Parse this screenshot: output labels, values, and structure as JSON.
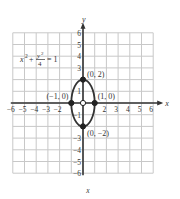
{
  "chart_data": {
    "type": "line",
    "title": "",
    "equation": "x² + y²/4 = 1",
    "equation_parts": {
      "x_term": "x",
      "x_exp": "2",
      "plus": "+",
      "y_num": "y",
      "y_exp": "2",
      "denom": "4",
      "equals": "= 1"
    },
    "xlabel": "x",
    "ylabel": "y",
    "caption": "x",
    "xlim": [
      -6,
      6
    ],
    "ylim": [
      -6,
      6
    ],
    "grid": true,
    "x_ticks": [
      "-6",
      "-5",
      "-4",
      "-3",
      "-2",
      "",
      "",
      "2",
      "3",
      "4",
      "5",
      "6"
    ],
    "y_ticks": [
      "6",
      "5",
      "4",
      "3",
      "1",
      "-1",
      "-3",
      "-4",
      "-5",
      "-6"
    ],
    "series": [
      {
        "name": "ellipse",
        "shape": "ellipse",
        "center": [
          0,
          0
        ],
        "a": 1,
        "b": 2
      }
    ],
    "points": [
      {
        "label": "(0,2)",
        "x": 0,
        "y": 2,
        "filled": true
      },
      {
        "label": "(1,0)",
        "x": 1,
        "y": 0,
        "filled": true
      },
      {
        "label": "(-1,0)",
        "x": -1,
        "y": 0,
        "filled": true
      },
      {
        "label": "(0,-2)",
        "x": 0,
        "y": -2,
        "filled": true
      },
      {
        "label": "",
        "x": 0,
        "y": 0,
        "filled": false
      }
    ]
  }
}
